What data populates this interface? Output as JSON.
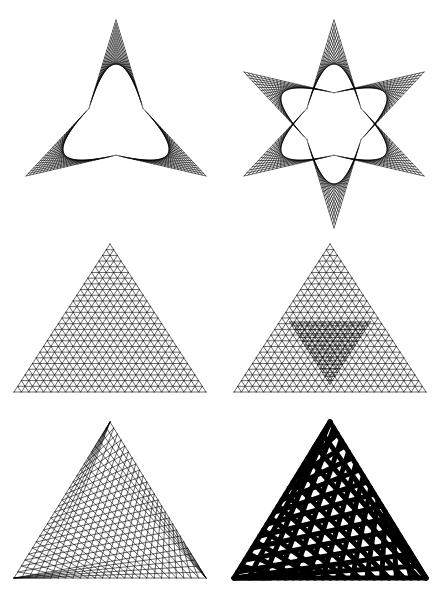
{
  "document": {
    "title": "Curve-Stitching Deltoid and Triangle Envelope Plate",
    "background_color": "#ffffff",
    "ink_color": "#000000",
    "width": 441,
    "height": 600,
    "layout": "2 columns x 3 rows of geometric string-art figures",
    "caption": ""
  },
  "chart_data": {
    "type": "line",
    "subtitle": "Six string-art constructions: straight chords whose envelopes form deltoids (three-cusped hypocycloids) and Reuleaux-like curved triangles",
    "xlabel": "",
    "ylabel": "",
    "grid": false,
    "legend": null,
    "axis_visible": false,
    "xlim": [
      0,
      441
    ],
    "ylim": [
      0,
      600
    ],
    "stroke_color": "#000000",
    "fill_color": "none",
    "figures": [
      {
        "index": 1,
        "name": "deltoid-envelope",
        "label": "Deltoid (three-cusped hypocycloid) envelope",
        "row": 1,
        "column": 1,
        "panel_x": 8,
        "panel_y": 12,
        "panel_w": 212,
        "panel_h": 198,
        "construction": "deltoid",
        "cusp_count": 3,
        "cusps": [
          [
            116,
            20
          ],
          [
            18,
            176
          ],
          [
            212,
            176
          ]
        ],
        "center": [
          116,
          124
        ],
        "radius": 104,
        "rotation_deg": -90,
        "line_count": 26,
        "stroke_width": 0.6,
        "rings": 1,
        "inverted": false
      },
      {
        "index": 2,
        "name": "six-point-star-double-deltoid",
        "label": "Six-pointed star: two deltoids superposed at 180 degrees",
        "row": 1,
        "column": 2,
        "panel_x": 228,
        "panel_y": 12,
        "panel_w": 212,
        "panel_h": 212,
        "construction": "double-deltoid-star",
        "cusp_count": 6,
        "center": [
          334,
          124
        ],
        "radius": 104,
        "rotation_deg": -90,
        "line_count": 22,
        "stroke_width": 0.6,
        "rings": 2,
        "inverted": false
      },
      {
        "index": 3,
        "name": "triangle-inscribed-curved-triangle",
        "label": "Triangle with inscribed curved-triangle envelope",
        "row": 2,
        "column": 1,
        "panel_x": 8,
        "panel_y": 238,
        "panel_w": 212,
        "panel_h": 160,
        "construction": "triangle-stitch",
        "cusp_count": 3,
        "triangle": [
          [
            110,
            244
          ],
          [
            14,
            392
          ],
          [
            206,
            392
          ]
        ],
        "divisions": 26,
        "offset_steps": 0,
        "stroke_width": 0.6,
        "nested_levels": 1
      },
      {
        "index": 4,
        "name": "triangle-with-nested-inner-deltoid",
        "label": "Triangle envelope with nested inverted inner deltoid",
        "row": 2,
        "column": 2,
        "panel_x": 228,
        "panel_y": 238,
        "panel_w": 212,
        "panel_h": 160,
        "construction": "triangle-stitch-nested",
        "cusp_count": 3,
        "triangle": [
          [
            330,
            244
          ],
          [
            234,
            392
          ],
          [
            426,
            392
          ]
        ],
        "divisions": 26,
        "offset_steps": 0,
        "stroke_width": 0.6,
        "nested_levels": 2,
        "inner_scale": 0.42,
        "inner_rotation_deg": 180
      },
      {
        "index": 5,
        "name": "triangle-rotated-inner-deltoid-thin",
        "label": "Triangle with skewed (rotated) inner deltoid, thin lines",
        "row": 3,
        "column": 1,
        "panel_x": 8,
        "panel_y": 414,
        "panel_w": 212,
        "panel_h": 172,
        "construction": "triangle-stitch-skew",
        "cusp_count": 3,
        "triangle": [
          [
            110,
            422
          ],
          [
            14,
            578
          ],
          [
            206,
            578
          ]
        ],
        "divisions": 26,
        "offset_steps": 5,
        "stroke_width": 0.6
      },
      {
        "index": 6,
        "name": "triangle-rotated-inner-deltoid-thick",
        "label": "Triangle with skewed inner deltoid, heavy stroke weight",
        "row": 3,
        "column": 2,
        "panel_x": 228,
        "panel_y": 414,
        "panel_w": 212,
        "panel_h": 172,
        "construction": "triangle-stitch-skew",
        "cusp_count": 3,
        "triangle": [
          [
            330,
            422
          ],
          [
            234,
            578
          ],
          [
            426,
            578
          ]
        ],
        "divisions": 13,
        "offset_steps": 2.5,
        "stroke_width": 5.0
      }
    ]
  }
}
